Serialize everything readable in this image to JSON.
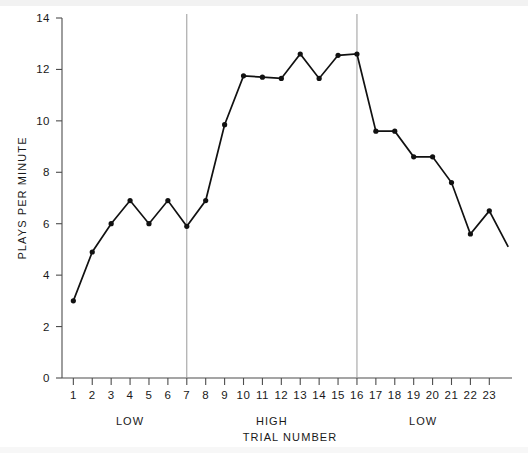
{
  "chart_data": {
    "type": "line",
    "title": "",
    "xlabel": "TRIAL NUMBER",
    "ylabel": "PLAYS PER MINUTE",
    "xlim": [
      0.4,
      24.2
    ],
    "ylim": [
      0,
      14
    ],
    "yticks": [
      0,
      2,
      4,
      6,
      8,
      10,
      12,
      14
    ],
    "ytick_labels": [
      "0",
      "2",
      "4",
      "6",
      "8",
      "10",
      "12",
      "14"
    ],
    "xticks": [
      1,
      2,
      3,
      4,
      5,
      6,
      7,
      8,
      9,
      10,
      11,
      12,
      13,
      14,
      15,
      16,
      17,
      18,
      19,
      20,
      21,
      22,
      23
    ],
    "xtick_labels": [
      "1",
      "2",
      "3",
      "4",
      "5",
      "6",
      "7",
      "8",
      "9",
      "10",
      "11",
      "12",
      "13",
      "14",
      "15",
      "16",
      "17",
      "18",
      "19",
      "20",
      "21",
      "22",
      "23"
    ],
    "grid": false,
    "legend": "none",
    "x": [
      1,
      2,
      3,
      4,
      5,
      6,
      7,
      8,
      9,
      10,
      11,
      12,
      13,
      14,
      15,
      16,
      17,
      18,
      19,
      20,
      21,
      22,
      23,
      24
    ],
    "values": [
      3.0,
      4.9,
      6.0,
      6.9,
      6.0,
      6.9,
      5.9,
      6.9,
      9.85,
      11.75,
      11.7,
      11.65,
      12.6,
      11.65,
      12.55,
      12.6,
      9.6,
      9.6,
      8.6,
      8.6,
      7.6,
      5.6,
      6.5,
      5.1
    ],
    "markers": [
      1,
      2,
      3,
      4,
      5,
      6,
      7,
      8,
      9,
      10,
      11,
      12,
      13,
      14,
      15,
      16,
      17,
      18,
      19,
      20,
      21,
      22,
      23
    ],
    "phase_dividers": [
      7,
      16
    ],
    "phases": [
      {
        "label": "LOW",
        "start": 1,
        "end": 7
      },
      {
        "label": "HIGH",
        "start": 7,
        "end": 16
      },
      {
        "label": "LOW",
        "start": 16,
        "end": 23
      }
    ],
    "colors": {
      "line": "#111111",
      "marker": "#111111",
      "axis": "#4d4d4d",
      "divider": "#9a9a9a",
      "background": "#ffffff"
    }
  }
}
